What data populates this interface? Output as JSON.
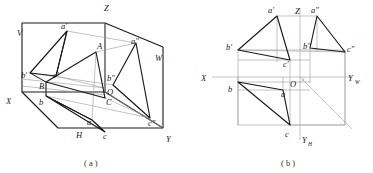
{
  "figure": {
    "type": "descriptive-geometry-diagram",
    "colors": {
      "ink": "#1a1a1a",
      "thin": "#8a8a8a",
      "paper": "#ffffff"
    },
    "captions": [
      {
        "id": "caption-a",
        "text": "( a )",
        "x": 92,
        "y": 163
      },
      {
        "id": "caption-b",
        "text": "( b )",
        "x": 289,
        "y": 163
      }
    ]
  },
  "panel_a": {
    "name": "pictorial-view",
    "axis_labels": [
      {
        "id": "axis-z-a",
        "text": "Z",
        "x": 104,
        "y": 11
      },
      {
        "id": "axis-x-a",
        "text": "X",
        "x": 8,
        "y": 101
      },
      {
        "id": "axis-y-a",
        "text": "Y",
        "x": 167,
        "y": 140
      },
      {
        "id": "plane-v",
        "text": "V",
        "x": 18,
        "y": 33
      },
      {
        "id": "plane-w",
        "text": "W",
        "x": 157,
        "y": 58
      },
      {
        "id": "plane-h",
        "text": "H",
        "x": 78,
        "y": 135
      },
      {
        "id": "origin-o",
        "text": "O",
        "x": 108,
        "y": 92
      }
    ],
    "point_labels": [
      {
        "id": "pt-a-prime",
        "text": "a'",
        "x": 64,
        "y": 30
      },
      {
        "id": "pt-b-prime",
        "text": "b'",
        "x": 24,
        "y": 77
      },
      {
        "id": "pt-c-prime",
        "text": "c'",
        "x": 54,
        "y": 80
      },
      {
        "id": "pt-A",
        "text": "A",
        "x": 98,
        "y": 46
      },
      {
        "id": "pt-B",
        "text": "B",
        "x": 41,
        "y": 87
      },
      {
        "id": "pt-C",
        "text": "C",
        "x": 108,
        "y": 104
      },
      {
        "id": "pt-a",
        "text": "a",
        "x": 89,
        "y": 124
      },
      {
        "id": "pt-b",
        "text": "b",
        "x": 41,
        "y": 103
      },
      {
        "id": "pt-c",
        "text": "c",
        "x": 104,
        "y": 136
      },
      {
        "id": "pt-a-dprime",
        "text": "a\"",
        "x": 133,
        "y": 44
      },
      {
        "id": "pt-b-dprime",
        "text": "b\"",
        "x": 110,
        "y": 79
      },
      {
        "id": "pt-c-dprime",
        "text": "c\"",
        "x": 151,
        "y": 123
      }
    ]
  },
  "panel_b": {
    "name": "orthographic-projection-view",
    "axis_labels": [
      {
        "id": "axis-z-b",
        "text": "Z",
        "x": 296,
        "y": 12
      },
      {
        "id": "axis-x-b",
        "text": "X",
        "x": 203,
        "y": 80
      },
      {
        "id": "axis-yw-b",
        "text": "Y",
        "x": 349,
        "y": 80,
        "sub": "W"
      },
      {
        "id": "axis-yh-b",
        "text": "Y",
        "x": 301,
        "y": 141,
        "sub": "H"
      },
      {
        "id": "origin-o-b",
        "text": "O",
        "x": 291,
        "y": 84
      }
    ],
    "point_labels": [
      {
        "id": "pt-a-prime-b",
        "text": "a'",
        "x": 270,
        "y": 13
      },
      {
        "id": "pt-a-dprime-b",
        "text": "a\"",
        "x": 312,
        "y": 13
      },
      {
        "id": "pt-b-prime-b",
        "text": "b'",
        "x": 228,
        "y": 50
      },
      {
        "id": "pt-b-dprime-b",
        "text": "b\"",
        "x": 305,
        "y": 49
      },
      {
        "id": "pt-c-prime-b",
        "text": "c'",
        "x": 285,
        "y": 66
      },
      {
        "id": "pt-c-dprime-b",
        "text": "c\"",
        "x": 349,
        "y": 53
      },
      {
        "id": "pt-b-b",
        "text": "b",
        "x": 229,
        "y": 91
      },
      {
        "id": "pt-a-b",
        "text": "a",
        "x": 282,
        "y": 96
      },
      {
        "id": "pt-c-b",
        "text": "c",
        "x": 286,
        "y": 136
      }
    ]
  }
}
